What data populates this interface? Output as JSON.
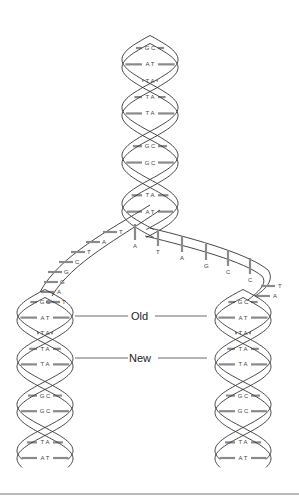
{
  "diagram": {
    "labels": {
      "old": "Old",
      "new": "New"
    },
    "parent_helix": {
      "base_pairs": [
        "G C",
        "A T",
        "T A",
        "T A",
        "T A",
        "G C",
        "G C",
        "G C",
        "T A",
        "T A",
        "A T",
        "G C"
      ]
    },
    "left_unpaired_strand": {
      "bases": [
        "T",
        "A",
        "T",
        "C",
        "G",
        "G",
        "A",
        "T"
      ]
    },
    "right_unpaired_strand": {
      "bases": [
        "A",
        "T",
        "A",
        "G",
        "C",
        "C",
        "T",
        "A"
      ]
    },
    "left_daughter_helix": {
      "base_pairs": [
        "G C",
        "A T",
        "T A",
        "T A",
        "T A",
        "G C",
        "G C",
        "G C",
        "T A",
        "T A",
        "A T"
      ]
    },
    "right_daughter_helix": {
      "base_pairs": [
        "G C",
        "A T",
        "T A",
        "T A",
        "T A",
        "G C",
        "G C",
        "G C",
        "T A",
        "T A",
        "A T"
      ]
    }
  }
}
